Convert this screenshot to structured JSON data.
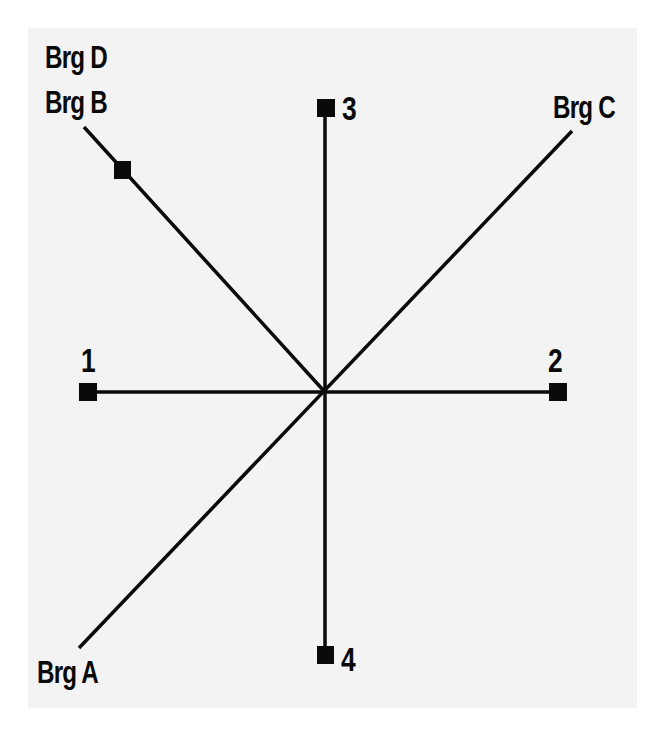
{
  "diagram": {
    "type": "bearing-direction-diagram",
    "center": [
      324,
      391
    ],
    "line_color": "#0a0a0a",
    "background_color": "#f3f3f3",
    "points": [
      {
        "id": "1",
        "label": "1",
        "pos": [
          88,
          392
        ]
      },
      {
        "id": "2",
        "label": "2",
        "pos": [
          557,
          392
        ]
      },
      {
        "id": "3",
        "label": "3",
        "pos": [
          326,
          108
        ]
      },
      {
        "id": "4",
        "label": "4",
        "pos": [
          325,
          655
        ]
      }
    ],
    "bearings": [
      {
        "id": "A",
        "label": "Brg A",
        "end": [
          79,
          648
        ]
      },
      {
        "id": "B",
        "label": "Brg B",
        "end": [
          84,
          127
        ],
        "marker": [
          122,
          170
        ]
      },
      {
        "id": "C",
        "label": "Brg C",
        "end": [
          572,
          131
        ]
      },
      {
        "id": "D",
        "label": "Brg D",
        "end": [
          84,
          127
        ]
      }
    ]
  },
  "labels": {
    "brg_d": "Brg D",
    "brg_b": "Brg B",
    "brg_c": "Brg C",
    "brg_a": "Brg A",
    "p1": "1",
    "p2": "2",
    "p3": "3",
    "p4": "4"
  }
}
